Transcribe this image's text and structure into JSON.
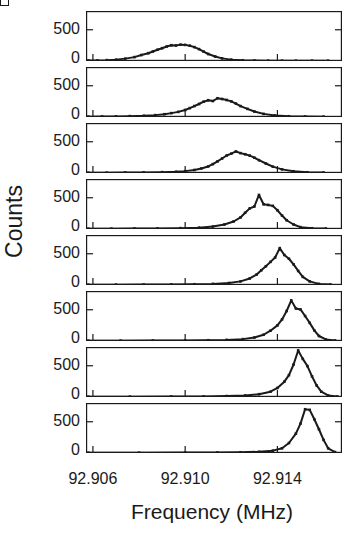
{
  "figure": {
    "corner_mark": "panel-label-bracket",
    "background_color": "#ffffff",
    "ink_color": "#1a1a1a"
  },
  "axes": {
    "ylabel": "Counts",
    "xlabel": "Frequency (MHz)",
    "ytick_labels": [
      "500",
      "0"
    ],
    "xtick_labels": [
      "92.906",
      "92.910",
      "92.914"
    ]
  },
  "chart_data": {
    "type": "scatter",
    "title": "",
    "subtitle": "",
    "xlabel": "Frequency (MHz)",
    "ylabel": "Counts",
    "grid": false,
    "legend": "none",
    "layout": "stacked vertical panels, shared x axis",
    "panel_count": 8,
    "xlim": [
      92.9057,
      92.9168
    ],
    "xticks": [
      92.906,
      92.91,
      92.914
    ],
    "xtick_labels": [
      "92.906",
      "92.910",
      "92.914"
    ],
    "ylim": [
      0,
      800
    ],
    "yticks": [
      0,
      500
    ],
    "ytick_labels": [
      "0",
      "500"
    ],
    "marker": "square-dot",
    "panels": [
      {
        "index": 1,
        "peak_center": 92.9098,
        "peak_height": 260,
        "fwhm": 0.0024,
        "x": [
          92.9058,
          92.9062,
          92.9066,
          92.907,
          92.9074,
          92.9078,
          92.9081,
          92.9084,
          92.9086,
          92.9088,
          92.909,
          92.9092,
          92.9094,
          92.9096,
          92.9098,
          92.91,
          92.9102,
          92.9104,
          92.9106,
          92.9108,
          92.911,
          92.9113,
          92.9116,
          92.912,
          92.9125,
          92.913,
          92.9136,
          92.9142,
          92.9148,
          92.9155,
          92.9162
        ],
        "y": [
          8,
          10,
          14,
          22,
          38,
          62,
          95,
          125,
          152,
          180,
          205,
          232,
          252,
          248,
          262,
          258,
          245,
          222,
          190,
          150,
          112,
          72,
          42,
          22,
          12,
          8,
          6,
          6,
          5,
          5,
          5
        ]
      },
      {
        "index": 2,
        "peak_center": 92.9114,
        "peak_height": 300,
        "fwhm": 0.0022,
        "x": [
          92.9058,
          92.9064,
          92.907,
          92.9076,
          92.9082,
          92.9087,
          92.9091,
          92.9094,
          92.9097,
          92.91,
          92.9102,
          92.9104,
          92.9106,
          92.9108,
          92.911,
          92.9112,
          92.9114,
          92.9116,
          92.9118,
          92.912,
          92.9122,
          92.9124,
          92.9127,
          92.913,
          92.9134,
          92.9139,
          92.9145,
          92.9152,
          92.916
        ],
        "y": [
          6,
          8,
          10,
          14,
          20,
          30,
          45,
          62,
          82,
          112,
          142,
          175,
          208,
          245,
          268,
          255,
          300,
          288,
          272,
          250,
          215,
          175,
          130,
          88,
          50,
          25,
          12,
          8,
          6
        ]
      },
      {
        "index": 3,
        "peak_center": 92.9122,
        "peak_height": 340,
        "fwhm": 0.002,
        "x": [
          92.9058,
          92.9066,
          92.9074,
          92.9082,
          92.909,
          92.9096,
          92.91,
          92.9104,
          92.9107,
          92.911,
          92.9112,
          92.9114,
          92.9116,
          92.9118,
          92.912,
          92.9122,
          92.9124,
          92.9126,
          92.9128,
          92.913,
          92.9132,
          92.9135,
          92.9138,
          92.9142,
          92.9147,
          92.9153,
          92.916
        ],
        "y": [
          5,
          6,
          8,
          10,
          14,
          20,
          30,
          48,
          72,
          105,
          142,
          185,
          232,
          280,
          310,
          345,
          318,
          300,
          278,
          245,
          205,
          152,
          102,
          58,
          28,
          12,
          7
        ]
      },
      {
        "index": 4,
        "peak_center": 92.9132,
        "peak_height": 545,
        "fwhm": 0.0017,
        "x": [
          92.9058,
          92.9068,
          92.9078,
          92.9088,
          92.9098,
          92.9106,
          92.9112,
          92.9117,
          92.9121,
          92.9124,
          92.9126,
          92.9128,
          92.913,
          92.9132,
          92.9134,
          92.9136,
          92.9138,
          92.914,
          92.9142,
          92.9144,
          92.9147,
          92.915,
          92.9155,
          92.9161
        ],
        "y": [
          5,
          6,
          8,
          10,
          14,
          22,
          40,
          72,
          120,
          185,
          260,
          330,
          360,
          545,
          395,
          385,
          370,
          300,
          215,
          140,
          72,
          30,
          12,
          7
        ]
      },
      {
        "index": 5,
        "peak_center": 92.9141,
        "peak_height": 590,
        "fwhm": 0.0014,
        "x": [
          92.9058,
          92.907,
          92.9082,
          92.9094,
          92.9104,
          92.9112,
          92.9119,
          92.9124,
          92.9128,
          92.9131,
          92.9133,
          92.9135,
          92.9137,
          92.9139,
          92.9141,
          92.9143,
          92.9145,
          92.9147,
          92.9149,
          92.9151,
          92.9154,
          92.9158,
          92.9163
        ],
        "y": [
          5,
          6,
          7,
          9,
          12,
          18,
          32,
          58,
          105,
          168,
          235,
          300,
          370,
          440,
          590,
          480,
          420,
          330,
          225,
          130,
          58,
          18,
          8
        ]
      },
      {
        "index": 6,
        "peak_center": 92.9146,
        "peak_height": 650,
        "fwhm": 0.0012,
        "x": [
          92.9058,
          92.9072,
          92.9086,
          92.91,
          92.911,
          92.9118,
          92.9125,
          92.913,
          92.9134,
          92.9137,
          92.914,
          92.9142,
          92.9144,
          92.9146,
          92.9148,
          92.915,
          92.9152,
          92.9154,
          92.9156,
          92.9158,
          92.9161,
          92.9165
        ],
        "y": [
          5,
          6,
          7,
          9,
          12,
          18,
          30,
          55,
          100,
          165,
          250,
          345,
          480,
          650,
          520,
          505,
          400,
          290,
          170,
          80,
          25,
          8
        ]
      },
      {
        "index": 7,
        "peak_center": 92.9149,
        "peak_height": 745,
        "fwhm": 0.001,
        "x": [
          92.9058,
          92.9076,
          92.9094,
          92.9108,
          92.9118,
          92.9126,
          92.9132,
          92.9137,
          92.914,
          92.9143,
          92.9145,
          92.9147,
          92.9149,
          92.9151,
          92.9153,
          92.9155,
          92.9157,
          92.9159,
          92.9162,
          92.9166
        ],
        "y": [
          5,
          6,
          8,
          10,
          15,
          25,
          45,
          85,
          145,
          245,
          350,
          520,
          745,
          610,
          495,
          330,
          185,
          85,
          25,
          8
        ]
      },
      {
        "index": 8,
        "peak_center": 92.9152,
        "peak_height": 700,
        "fwhm": 0.001,
        "x": [
          92.9058,
          92.908,
          92.91,
          92.9114,
          92.9124,
          92.9132,
          92.9138,
          92.9142,
          92.9145,
          92.9148,
          92.915,
          92.9152,
          92.9154,
          92.9156,
          92.9158,
          92.916,
          92.9162,
          92.9165
        ],
        "y": [
          5,
          6,
          7,
          9,
          12,
          20,
          38,
          75,
          160,
          310,
          470,
          700,
          690,
          540,
          380,
          210,
          75,
          15
        ]
      }
    ]
  }
}
